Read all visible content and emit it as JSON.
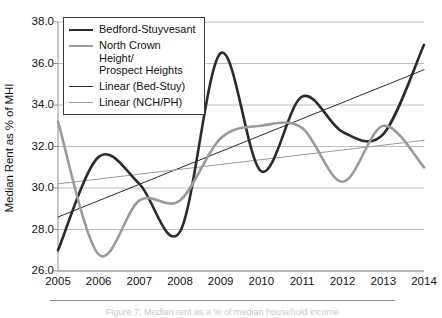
{
  "axes": {
    "ylabel": "Median Rent as % of MHI",
    "yticks": [
      "38.0",
      "36.0",
      "34.0",
      "32.0",
      "30.0",
      "28.0",
      "26.0"
    ],
    "xticks": [
      "2005",
      "2006",
      "2007",
      "2008",
      "2009",
      "2010",
      "2011",
      "2012",
      "2013",
      "2014"
    ]
  },
  "legend": {
    "items": [
      {
        "label": "Bedford-Stuyvesant",
        "style": "sw-thick-dark",
        "icon": "legend-line-icon"
      },
      {
        "label": "North Crown Height/\nProspect Heights",
        "style": "sw-thick-gray",
        "icon": "legend-line-icon"
      },
      {
        "label": "Linear (Bed-Stuy)",
        "style": "sw-thin-dark",
        "icon": "legend-line-icon"
      },
      {
        "label": "Linear (NCH/PH)",
        "style": "sw-thin-gray",
        "icon": "legend-line-icon"
      }
    ]
  },
  "caption": {
    "text": "Figure 7: Median rent as a % of median household income"
  },
  "colors": {
    "bed_stuy": "#2b2b2b",
    "nch_ph": "#9a9a9a",
    "grid": "#b8b8b8",
    "axis": "#8d8d8d",
    "background": "#ffffff"
  },
  "chart_data": {
    "type": "line",
    "title": "",
    "xlabel": "",
    "ylabel": "Median Rent as % of MHI",
    "x": [
      2005,
      2006,
      2007,
      2008,
      2009,
      2010,
      2011,
      2012,
      2013,
      2014
    ],
    "xlim": [
      2005,
      2014
    ],
    "ylim": [
      26.0,
      38.0
    ],
    "ytick_step": 2.0,
    "grid": true,
    "legend_position": "upper-left-inside",
    "smoothing": "spline",
    "series": [
      {
        "name": "Bedford-Stuyvesant",
        "type": "line",
        "color": "#2b2b2b",
        "width": 2.6,
        "values": [
          27.0,
          31.5,
          30.2,
          27.9,
          36.5,
          30.8,
          34.4,
          32.7,
          32.6,
          36.9
        ]
      },
      {
        "name": "North Crown Height/Prospect Heights",
        "type": "line",
        "color": "#9a9a9a",
        "width": 2.6,
        "values": [
          33.2,
          26.8,
          29.4,
          29.4,
          32.4,
          33.0,
          32.9,
          30.3,
          33.0,
          31.0
        ]
      },
      {
        "name": "Linear (Bed-Stuy)",
        "type": "trendline",
        "color": "#2b2b2b",
        "width": 1.0,
        "endpoints": [
          [
            2005,
            28.6
          ],
          [
            2014,
            35.7
          ]
        ]
      },
      {
        "name": "Linear (NCH/PH)",
        "type": "trendline",
        "color": "#9a9a9a",
        "width": 1.0,
        "endpoints": [
          [
            2005,
            30.2
          ],
          [
            2014,
            32.3
          ]
        ]
      }
    ]
  }
}
